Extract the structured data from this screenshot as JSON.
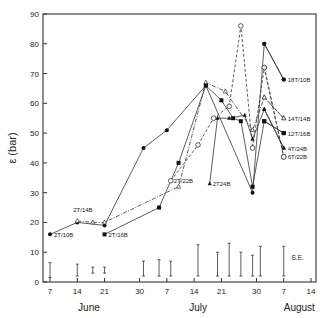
{
  "chart_data": {
    "type": "line",
    "title": "",
    "ylabel": "ε (bar)",
    "xlabel": "",
    "ylim": [
      0,
      90
    ],
    "yticks": [
      0,
      10,
      20,
      30,
      40,
      50,
      60,
      70,
      80,
      90
    ],
    "x_ticks": [
      {
        "label": "7",
        "day": 7
      },
      {
        "label": "14",
        "day": 14
      },
      {
        "label": "21",
        "day": 21
      },
      {
        "label": "30",
        "day": 30
      },
      {
        "label": "7",
        "day": 37
      },
      {
        "label": "14",
        "day": 44
      },
      {
        "label": "21",
        "day": 51
      },
      {
        "label": "30",
        "day": 60
      },
      {
        "label": "7",
        "day": 67
      },
      {
        "label": "14",
        "day": 74
      }
    ],
    "months": [
      {
        "label": "June",
        "day": 17
      },
      {
        "label": "July",
        "day": 45
      },
      {
        "label": "August",
        "day": 71
      }
    ],
    "grid": false,
    "legend_position": "inline labels at series ends",
    "series": [
      {
        "name": "2T/10B",
        "marker": "filled-circle",
        "dash": "solid",
        "label_at": "start",
        "points": [
          [
            7,
            16
          ],
          [
            14,
            20
          ],
          [
            21,
            19
          ],
          [
            31,
            45
          ],
          [
            37,
            51
          ],
          [
            47,
            66
          ],
          [
            59,
            30
          ],
          [
            62,
            80
          ],
          [
            67,
            68
          ]
        ]
      },
      {
        "name": "2T/14B",
        "marker": "open-triangle",
        "dash": "dashdot",
        "label_at": "start",
        "points": [
          [
            14,
            20.5
          ],
          [
            18,
            20
          ],
          [
            21,
            20
          ],
          [
            40,
            32
          ],
          [
            47,
            67
          ],
          [
            52,
            64
          ],
          [
            59,
            51
          ],
          [
            62,
            62
          ],
          [
            67,
            55
          ]
        ]
      },
      {
        "name": "2T/16B",
        "marker": "filled-square",
        "dash": "solid",
        "label_at": "start",
        "points": [
          [
            21,
            16
          ],
          [
            35,
            25
          ],
          [
            40,
            40
          ],
          [
            47,
            66
          ],
          [
            51,
            61
          ],
          [
            54,
            55
          ],
          [
            56,
            54
          ],
          [
            59,
            32
          ],
          [
            62,
            54
          ],
          [
            67,
            50
          ]
        ]
      },
      {
        "name": "2T/22B",
        "marker": "open-circle",
        "dash": "dashed",
        "label_at": "start",
        "points": [
          [
            38,
            34
          ],
          [
            45,
            46
          ],
          [
            49,
            55
          ],
          [
            53,
            59
          ],
          [
            56,
            86
          ],
          [
            59,
            45
          ],
          [
            62,
            72
          ],
          [
            67,
            42
          ]
        ]
      },
      {
        "name": "2T24B",
        "marker": "filled-triangle",
        "dash": "solid",
        "label_at": "start",
        "points": [
          [
            48,
            33
          ],
          [
            50,
            55
          ],
          [
            53,
            55
          ],
          [
            57,
            56
          ],
          [
            59,
            48
          ],
          [
            62,
            58
          ],
          [
            67,
            45
          ]
        ]
      },
      {
        "name": "18T/10B",
        "marker": "filled-circle",
        "dash": "solid",
        "label_at": "end",
        "points": [
          [
            62,
            80
          ],
          [
            67,
            68
          ]
        ]
      },
      {
        "name": "14T/14B",
        "marker": "open-triangle",
        "dash": "dashed",
        "label_at": "end",
        "points": [
          [
            62,
            62
          ],
          [
            67,
            55
          ]
        ]
      },
      {
        "name": "12T/16B",
        "marker": "filled-square",
        "dash": "solid",
        "label_at": "end",
        "points": [
          [
            62,
            54
          ],
          [
            67,
            50
          ]
        ]
      },
      {
        "name": "4T/24B",
        "marker": "filled-triangle",
        "dash": "solid",
        "label_at": "end",
        "points": [
          [
            62,
            58
          ],
          [
            67,
            45
          ]
        ]
      },
      {
        "name": "6T/22B",
        "marker": "open-circle",
        "dash": "dashed",
        "label_at": "end",
        "points": [
          [
            62,
            72
          ],
          [
            67,
            42
          ]
        ]
      }
    ],
    "se_bars": {
      "label": "S.E.",
      "bars": [
        {
          "day": 7,
          "low": 1.5,
          "high": 6.5
        },
        {
          "day": 14,
          "low": 2,
          "high": 6
        },
        {
          "day": 18,
          "low": 3,
          "high": 5
        },
        {
          "day": 21,
          "low": 3,
          "high": 5
        },
        {
          "day": 31,
          "low": 2,
          "high": 7
        },
        {
          "day": 35,
          "low": 2,
          "high": 7.5
        },
        {
          "day": 38,
          "low": 2,
          "high": 7
        },
        {
          "day": 45,
          "low": 2,
          "high": 12.5
        },
        {
          "day": 50,
          "low": 2,
          "high": 10
        },
        {
          "day": 53,
          "low": 2,
          "high": 13
        },
        {
          "day": 56,
          "low": 2,
          "high": 10
        },
        {
          "day": 59,
          "low": 2,
          "high": 9
        },
        {
          "day": 61,
          "low": 2,
          "high": 12
        },
        {
          "day": 67,
          "low": 2,
          "high": 12
        }
      ]
    }
  }
}
